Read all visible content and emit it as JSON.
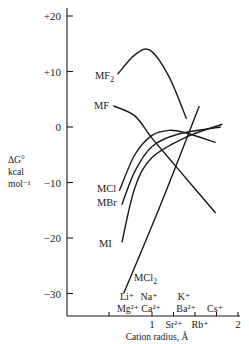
{
  "chart_data": {
    "type": "line",
    "title": "",
    "xlabel": "Cation radius, Å",
    "ylabel": "ΔG°s kcal mol⁻¹",
    "ylabel_lines": [
      "ΔG°",
      "kcal",
      "mol⁻¹"
    ],
    "xlim": [
      0,
      2
    ],
    "ylim": [
      -34,
      22
    ],
    "grid": false,
    "legend": "inline labels",
    "y_ticks": [
      "+20",
      "+10",
      "0",
      "−10",
      "−20",
      "−30"
    ],
    "x_ticks": [
      "1",
      "2"
    ],
    "cation_labels": {
      "row_top": [
        "Li⁺",
        "Na⁺",
        "K⁺"
      ],
      "row_middle": [
        "Mg²⁺",
        "Ca²⁺",
        "Ba²⁺",
        "Cs⁺"
      ],
      "row_bottom": [
        "Sr²⁺",
        "Rb⁺"
      ]
    },
    "series": [
      {
        "name": "MF₂",
        "label_main": "MF",
        "label_sub": "2",
        "x": [
          0.6,
          0.8,
          0.98,
          1.2,
          1.4
        ],
        "y": [
          9.5,
          13.0,
          13.8,
          9.0,
          1.5
        ]
      },
      {
        "name": "MF",
        "label_main": "MF",
        "label_sub": "",
        "x": [
          0.55,
          0.8,
          1.0,
          1.3,
          1.74
        ],
        "y": [
          3.8,
          2.0,
          -2.0,
          -7.5,
          -15.5
        ]
      },
      {
        "name": "MCl",
        "label_main": "MCl",
        "label_sub": "",
        "x": [
          0.62,
          0.8,
          1.0,
          1.2,
          1.38,
          1.74
        ],
        "y": [
          -11.5,
          -5.0,
          -1.5,
          -0.6,
          -1.0,
          -2.8
        ]
      },
      {
        "name": "MBr",
        "label_main": "MBr",
        "label_sub": "",
        "x": [
          0.65,
          0.8,
          1.0,
          1.3,
          1.8
        ],
        "y": [
          -14.0,
          -8.0,
          -3.5,
          -1.3,
          0.0
        ]
      },
      {
        "name": "MI",
        "label_main": "MI",
        "label_sub": "",
        "x": [
          0.65,
          0.8,
          1.0,
          1.4,
          1.82
        ],
        "y": [
          -20.8,
          -11.0,
          -5.5,
          -1.8,
          0.5
        ]
      },
      {
        "name": "MCl₂",
        "label_main": "MCl",
        "label_sub": "2",
        "x": [
          0.67,
          1.1,
          1.55
        ],
        "y": [
          -30.0,
          -14.0,
          3.8
        ]
      }
    ]
  }
}
